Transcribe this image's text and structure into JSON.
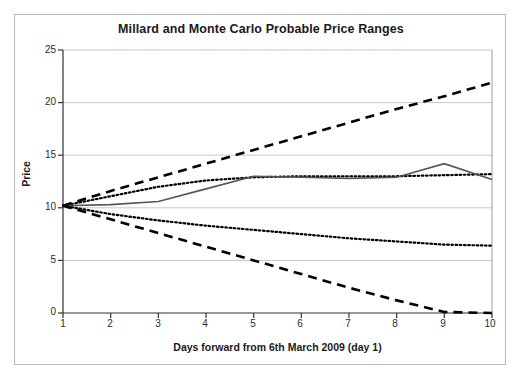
{
  "chart_data": {
    "type": "line",
    "title": "Millard and Monte Carlo Probable Price Ranges",
    "xlabel": "Days forward from 6th March 2009 (day 1)",
    "ylabel": "Price",
    "xlim": [
      1,
      10
    ],
    "ylim": [
      0,
      25
    ],
    "xticks": [
      1,
      2,
      3,
      4,
      5,
      6,
      7,
      8,
      9,
      10
    ],
    "yticks": [
      0,
      5,
      10,
      15,
      20,
      25
    ],
    "grid": "horizontal",
    "legend": "none",
    "x": [
      1,
      2,
      3,
      4,
      5,
      6,
      7,
      8,
      9,
      10
    ],
    "series": [
      {
        "name": "Monte Carlo upper bound",
        "style": "dashed",
        "color": "#000000",
        "values": [
          10.2,
          11.6,
          12.9,
          14.2,
          15.5,
          16.8,
          18.1,
          19.4,
          20.6,
          21.9
        ]
      },
      {
        "name": "Millard upper bound",
        "style": "dotted",
        "color": "#000000",
        "values": [
          10.2,
          11.1,
          12.0,
          12.6,
          12.9,
          13.0,
          13.0,
          13.0,
          13.1,
          13.2
        ]
      },
      {
        "name": "Actual price",
        "style": "solid",
        "color": "#555555",
        "values": [
          10.2,
          10.3,
          10.6,
          11.8,
          13.0,
          12.9,
          12.8,
          12.9,
          14.2,
          12.7
        ]
      },
      {
        "name": "Millard lower bound",
        "style": "dotted",
        "color": "#000000",
        "values": [
          10.2,
          9.4,
          8.8,
          8.3,
          7.9,
          7.5,
          7.1,
          6.8,
          6.5,
          6.4
        ]
      },
      {
        "name": "Monte Carlo lower bound",
        "style": "dashed",
        "color": "#000000",
        "values": [
          10.2,
          8.9,
          7.6,
          6.3,
          5.0,
          3.7,
          2.4,
          1.2,
          0.1,
          0.0
        ]
      }
    ]
  },
  "axes": {
    "y_tick_labels": [
      "25",
      "20",
      "15",
      "10",
      "5",
      "0"
    ],
    "x_tick_labels": [
      "1",
      "2",
      "3",
      "4",
      "5",
      "6",
      "7",
      "8",
      "9",
      "10"
    ]
  },
  "colors": {
    "frame": "#b8b8b8",
    "axis": "#333333",
    "grid": "#c9c9c9",
    "series_dark": "#000000",
    "series_solid": "#555555",
    "text": "#1a1a1a"
  }
}
